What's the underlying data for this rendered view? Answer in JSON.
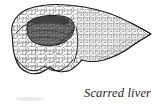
{
  "figure": {
    "caption": "Scarred liver",
    "subject": "liver",
    "condition": "scarred",
    "illustration_style": "pen-and-ink stipple line drawing",
    "background_color": "#fdfdfc",
    "ink_color": "#2b2b2b",
    "shadow_color": "#5a5a5a",
    "parts": [
      {
        "name": "right-lobe",
        "label": "right lobe"
      },
      {
        "name": "left-lobe",
        "label": "left lobe"
      },
      {
        "name": "nodular-surface",
        "label": "nodular scarred surface"
      },
      {
        "name": "cut-recess",
        "label": "shadowed recess"
      }
    ]
  }
}
